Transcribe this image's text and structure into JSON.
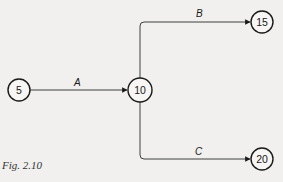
{
  "diagram": {
    "type": "activity-network",
    "nodes": [
      {
        "id": "n5",
        "label": "5"
      },
      {
        "id": "n10",
        "label": "10"
      },
      {
        "id": "n15",
        "label": "15"
      },
      {
        "id": "n20",
        "label": "20"
      }
    ],
    "edges": [
      {
        "from": "n5",
        "to": "n10",
        "label": "A"
      },
      {
        "from": "n10",
        "to": "n15",
        "label": "B"
      },
      {
        "from": "n10",
        "to": "n20",
        "label": "C"
      }
    ]
  },
  "caption": "Fig. 2.10",
  "colors": {
    "background": "#f1f0ee",
    "ink": "#1a1a1a"
  }
}
